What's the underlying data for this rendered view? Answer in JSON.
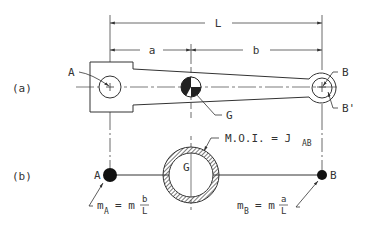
{
  "figure": {
    "panel_a": {
      "label": "(a)",
      "dimensions": {
        "total": "L",
        "left": "a",
        "right": "b"
      },
      "points": {
        "left_pivot": "A",
        "right_pivot": "B",
        "right_pivot_alt": "B'",
        "center_of_gravity": "G"
      }
    },
    "panel_b": {
      "label": "(b)",
      "points": {
        "left_mass": "A",
        "right_mass": "B",
        "center": "G"
      },
      "moi_label": "M.O.I. = J",
      "moi_sub": "AB",
      "mass_a": {
        "m": "m",
        "sub": "A",
        "eq": "= m",
        "num": "b",
        "den": "L"
      },
      "mass_b": {
        "m": "m",
        "sub": "B",
        "eq": "= m",
        "num": "a",
        "den": "L"
      }
    },
    "colors": {
      "ink": "#333333",
      "background": "#ffffff"
    }
  }
}
